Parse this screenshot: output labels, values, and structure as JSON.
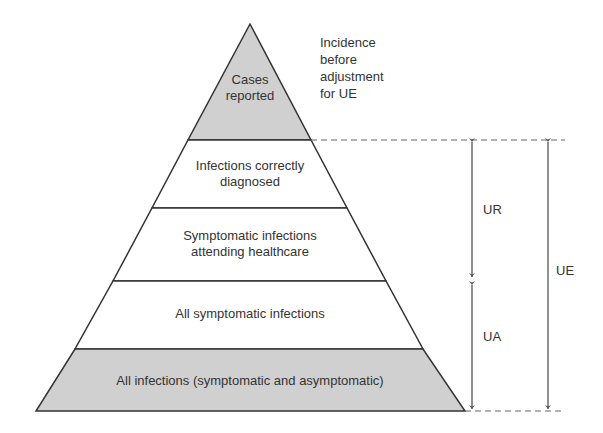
{
  "diagram": {
    "colors": {
      "shaded_fill": "#d0d0d0",
      "white_fill": "#ffffff",
      "stroke": "#333333",
      "arrow": "#555555",
      "text": "#333333"
    },
    "levels": [
      {
        "name": "cases-reported",
        "lines": [
          "Cases",
          "reported"
        ],
        "shaded": true
      },
      {
        "name": "infections-correctly-diagnosed",
        "lines": [
          "Infections correctly",
          "diagnosed"
        ],
        "shaded": false
      },
      {
        "name": "symptomatic-attending-healthcare",
        "lines": [
          "Symptomatic infections",
          "attending healthcare"
        ],
        "shaded": false
      },
      {
        "name": "all-symptomatic-infections",
        "lines": [
          "All symptomatic infections"
        ],
        "shaded": false
      },
      {
        "name": "all-infections",
        "lines": [
          "All infections (symptomatic and asymptomatic)"
        ],
        "shaded": true
      }
    ],
    "annotation": {
      "lines": [
        "Incidence",
        "before",
        "adjustment",
        "for UE"
      ]
    },
    "arrows": [
      {
        "name": "ur-arrow",
        "label": "UR",
        "meaning": "spans correctly diagnosed to symptomatic attending healthcare"
      },
      {
        "name": "ua-arrow",
        "label": "UA",
        "meaning": "spans all symptomatic to all infections"
      },
      {
        "name": "ue-arrow",
        "label": "UE",
        "meaning": "spans cases reported boundary to all infections"
      }
    ]
  }
}
